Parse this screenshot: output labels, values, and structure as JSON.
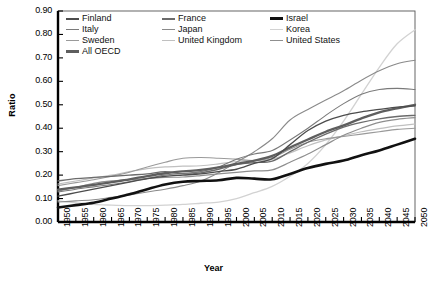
{
  "chart_data": {
    "type": "line",
    "title": "",
    "xlabel": "Year",
    "ylabel": "Ratio",
    "xlim": [
      1950,
      2050
    ],
    "ylim": [
      0.0,
      0.9
    ],
    "grid": false,
    "legend_position": "top-left-inside",
    "x": [
      1950,
      1955,
      1960,
      1965,
      1970,
      1975,
      1980,
      1985,
      1990,
      1995,
      2000,
      2005,
      2010,
      2015,
      2020,
      2025,
      2030,
      2035,
      2040,
      2045,
      2050
    ],
    "xticklabels": [
      "1950",
      "1955",
      "1960",
      "1965",
      "1970",
      "1975",
      "1980",
      "1985",
      "1990",
      "1995",
      "2000",
      "2005",
      "2010",
      "2015",
      "2020",
      "2025",
      "2030",
      "2035",
      "2040",
      "2045",
      "2050"
    ],
    "yticklabels": [
      "0.00",
      "0.10",
      "0.20",
      "0.30",
      "0.40",
      "0.50",
      "0.60",
      "0.70",
      "0.80",
      "0.90"
    ],
    "series": [
      {
        "name": "Finland",
        "color": "#4c4c4c",
        "width": 1.3,
        "values": [
          0.11,
          0.125,
          0.14,
          0.155,
          0.17,
          0.185,
          0.195,
          0.2,
          0.205,
          0.215,
          0.225,
          0.25,
          0.27,
          0.33,
          0.39,
          0.43,
          0.455,
          0.47,
          0.48,
          0.49,
          0.495
        ]
      },
      {
        "name": "France",
        "color": "#6b6b6b",
        "width": 1.3,
        "values": [
          0.175,
          0.185,
          0.19,
          0.195,
          0.2,
          0.205,
          0.215,
          0.205,
          0.21,
          0.225,
          0.245,
          0.253,
          0.26,
          0.3,
          0.34,
          0.375,
          0.405,
          0.425,
          0.44,
          0.45,
          0.455
        ]
      },
      {
        "name": "Israel",
        "color": "#111111",
        "width": 2.6,
        "values": [
          0.062,
          0.072,
          0.082,
          0.1,
          0.118,
          0.14,
          0.16,
          0.172,
          0.175,
          0.178,
          0.188,
          0.185,
          0.182,
          0.205,
          0.23,
          0.248,
          0.262,
          0.285,
          0.305,
          0.33,
          0.355
        ]
      },
      {
        "name": "Italy",
        "color": "#7a7a7a",
        "width": 1.1,
        "values": [
          0.128,
          0.14,
          0.15,
          0.16,
          0.172,
          0.186,
          0.2,
          0.207,
          0.215,
          0.235,
          0.268,
          0.29,
          0.305,
          0.35,
          0.4,
          0.455,
          0.505,
          0.545,
          0.565,
          0.57,
          0.565
        ]
      },
      {
        "name": "Japan",
        "color": "#8a8a8a",
        "width": 1.1,
        "values": [
          0.085,
          0.09,
          0.095,
          0.105,
          0.115,
          0.128,
          0.14,
          0.155,
          0.175,
          0.21,
          0.255,
          0.3,
          0.355,
          0.435,
          0.48,
          0.52,
          0.56,
          0.605,
          0.645,
          0.675,
          0.69
        ]
      },
      {
        "name": "Korea",
        "color": "#d2d2d2",
        "width": 1.3,
        "values": [
          0.09,
          0.082,
          0.075,
          0.072,
          0.07,
          0.07,
          0.072,
          0.075,
          0.08,
          0.085,
          0.1,
          0.125,
          0.152,
          0.195,
          0.25,
          0.33,
          0.43,
          0.545,
          0.66,
          0.76,
          0.82
        ]
      },
      {
        "name": "Sweden",
        "color": "#9a9a9a",
        "width": 1.1,
        "values": [
          0.155,
          0.168,
          0.18,
          0.195,
          0.212,
          0.235,
          0.255,
          0.272,
          0.275,
          0.272,
          0.268,
          0.262,
          0.275,
          0.31,
          0.34,
          0.355,
          0.365,
          0.375,
          0.385,
          0.395,
          0.4
        ]
      },
      {
        "name": "United Kingdom",
        "color": "#c0c0c0",
        "width": 1.2,
        "values": [
          0.162,
          0.175,
          0.188,
          0.2,
          0.215,
          0.228,
          0.235,
          0.238,
          0.24,
          0.248,
          0.258,
          0.262,
          0.268,
          0.295,
          0.325,
          0.35,
          0.368,
          0.385,
          0.398,
          0.41,
          0.418
        ]
      },
      {
        "name": "United States",
        "color": "#8f8f8f",
        "width": 1.2,
        "values": [
          0.132,
          0.148,
          0.165,
          0.175,
          0.18,
          0.185,
          0.19,
          0.192,
          0.198,
          0.205,
          0.212,
          0.218,
          0.222,
          0.255,
          0.29,
          0.33,
          0.37,
          0.4,
          0.425,
          0.438,
          0.445
        ]
      },
      {
        "name": "All OECD",
        "color": "#5e5e5e",
        "width": 2.3,
        "values": [
          0.138,
          0.148,
          0.158,
          0.17,
          0.182,
          0.196,
          0.208,
          0.216,
          0.222,
          0.233,
          0.248,
          0.262,
          0.282,
          0.318,
          0.352,
          0.385,
          0.412,
          0.442,
          0.468,
          0.485,
          0.5
        ]
      }
    ]
  },
  "legend": {
    "entries": [
      {
        "label": "Finland",
        "color": "#4c4c4c",
        "width": 2.0
      },
      {
        "label": "France",
        "color": "#6b6b6b",
        "width": 2.0
      },
      {
        "label": "Israel",
        "color": "#111111",
        "width": 3.4
      },
      {
        "label": "Italy",
        "color": "#7a7a7a",
        "width": 1.4
      },
      {
        "label": "Japan",
        "color": "#8a8a8a",
        "width": 1.4
      },
      {
        "label": "Korea",
        "color": "#d2d2d2",
        "width": 1.8
      },
      {
        "label": "Sweden",
        "color": "#9a9a9a",
        "width": 1.6
      },
      {
        "label": "United Kingdom",
        "color": "#c0c0c0",
        "width": 1.8
      },
      {
        "label": "United States",
        "color": "#8f8f8f",
        "width": 1.6
      },
      {
        "label": "All OECD",
        "color": "#5e5e5e",
        "width": 3.2
      }
    ]
  }
}
